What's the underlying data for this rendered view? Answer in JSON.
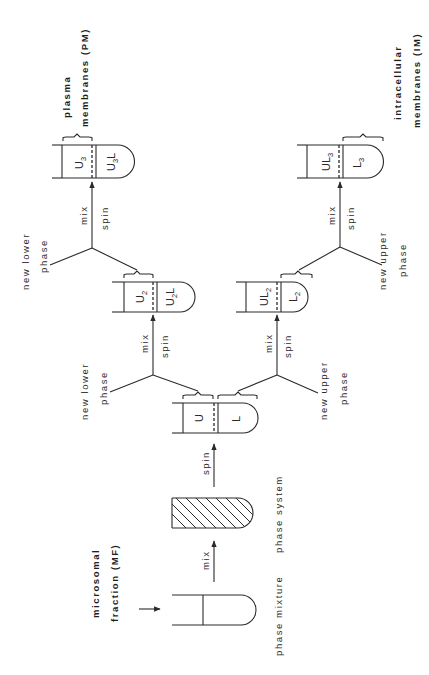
{
  "diagram": {
    "orientation": "rotated 90deg counter-clockwise (text reads bottom-to-top)",
    "colors": {
      "line": "#2a2a2a",
      "background": "#ffffff"
    },
    "input_label": {
      "line1": "microsomal",
      "line2": "fraction (MF)"
    },
    "steps": {
      "mix1": "mix",
      "spin1": "spin",
      "upper_mix": "mix",
      "upper_spin": "spin",
      "lower_mix": "mix",
      "lower_spin": "spin",
      "upper_mix2": "mix",
      "upper_spin2": "spin",
      "lower_mix2": "mix",
      "lower_spin2": "spin"
    },
    "tube_captions": {
      "phase_mixture": "phase mixture",
      "phase_system": "phase system"
    },
    "added_phases": {
      "upper_branch_1": {
        "line1": "new lower",
        "line2": "phase"
      },
      "upper_branch_2": {
        "line1": "new lower",
        "line2": "phase"
      },
      "lower_branch_1": {
        "line1": "new upper",
        "line2": "phase"
      },
      "lower_branch_2": {
        "line1": "new upper",
        "line2": "phase"
      }
    },
    "tubes": {
      "first_partition": {
        "top": "U",
        "bottom": "L"
      },
      "upper_2": {
        "top": "U",
        "top_sub": "2",
        "bottom": "U",
        "bottom_sub": "2",
        "bottom_suffix": "L"
      },
      "lower_2": {
        "top": "UL",
        "top_sub": "2",
        "bottom": "L",
        "bottom_sub": "2"
      },
      "upper_3": {
        "top": "U",
        "top_sub": "3",
        "bottom": "U",
        "bottom_sub": "3",
        "bottom_suffix": "L"
      },
      "lower_3": {
        "top": "UL",
        "top_sub": "3",
        "bottom": "L",
        "bottom_sub": "3"
      }
    },
    "outputs": {
      "plasma": {
        "line1": "plasma",
        "line2": "membranes (PM)"
      },
      "intracellular": {
        "line1": "intracellular",
        "line2": "membranes (IM)"
      }
    }
  }
}
